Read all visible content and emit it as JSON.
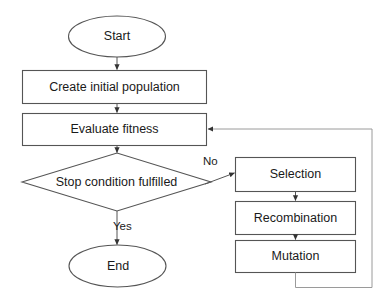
{
  "diagram": {
    "type": "flowchart",
    "background_color": "#ffffff",
    "stroke_color": "#555555",
    "text_color": "#1a1a1a",
    "nodes": {
      "start": {
        "label": "Start",
        "shape": "ellipse"
      },
      "create_population": {
        "label": "Create initial population",
        "shape": "rectangle"
      },
      "evaluate_fitness": {
        "label": "Evaluate fitness",
        "shape": "rectangle"
      },
      "stop_condition": {
        "label": "Stop condition fulfilled",
        "shape": "diamond"
      },
      "end": {
        "label": "End",
        "shape": "ellipse"
      },
      "selection": {
        "label": "Selection",
        "shape": "rectangle"
      },
      "recombination": {
        "label": "Recombination",
        "shape": "rectangle"
      },
      "mutation": {
        "label": "Mutation",
        "shape": "rectangle"
      }
    },
    "edge_labels": {
      "no": "No",
      "yes": "Yes"
    }
  }
}
